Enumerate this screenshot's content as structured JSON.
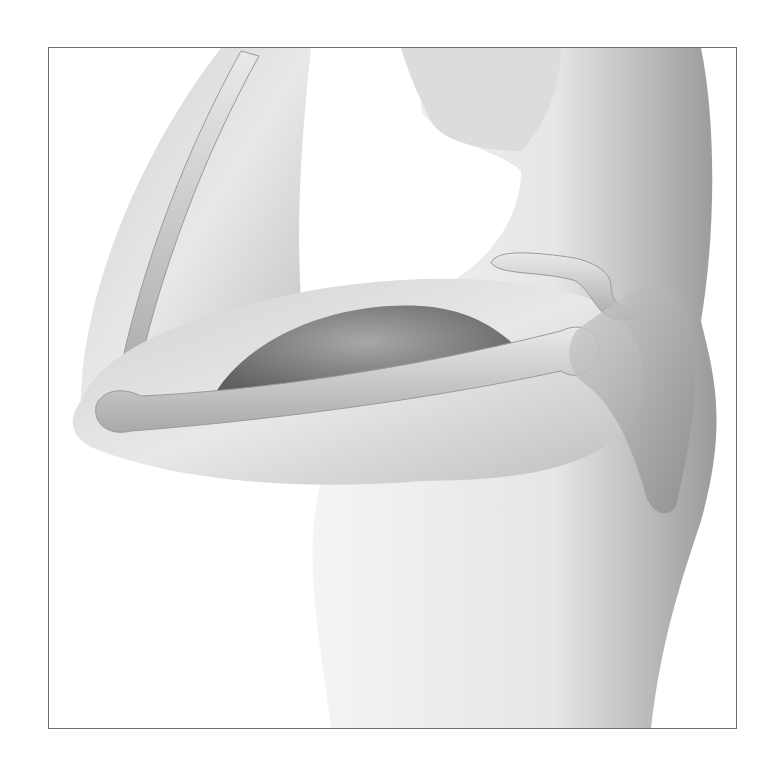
{
  "figure": {
    "style": "grayscale airbrush",
    "colors": {
      "background": "#ffffff",
      "frame": "#6e6e6e",
      "skin_light": "#ececec",
      "skin_mid": "#c4c4c4",
      "skin_dark": "#8e8e8e",
      "bone": "#d8d8d8",
      "muscle": "#7a7a7a"
    },
    "structures": [
      "forearm",
      "upper-arm",
      "biceps-muscle",
      "humerus",
      "radius-ulna",
      "clavicle",
      "scapula",
      "head",
      "torso"
    ]
  }
}
